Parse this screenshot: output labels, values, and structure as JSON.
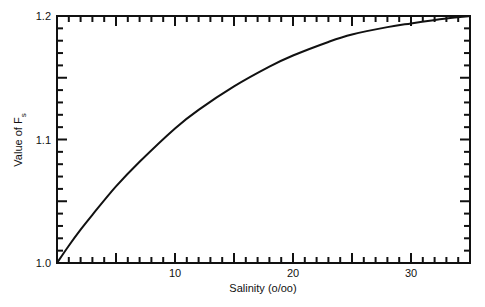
{
  "chart_data": {
    "type": "line",
    "title": "",
    "xlabel": "Salinity (o/oo)",
    "ylabel": "Value of F_s",
    "ylabel_main": "Value of F",
    "ylabel_sub": "s",
    "xlim": [
      0,
      35
    ],
    "ylim": [
      1.0,
      1.2
    ],
    "x_tick_labels": [
      "10",
      "20",
      "30"
    ],
    "x_tick_values": [
      10,
      20,
      30
    ],
    "y_tick_labels": [
      "1.0",
      "1.1",
      "1.2"
    ],
    "y_tick_values": [
      1.0,
      1.1,
      1.2
    ],
    "minor_x_tick_step": 1,
    "major_x_tick_step": 5,
    "minor_y_tick_step": 0.01,
    "major_y_tick_step": 0.05,
    "grid": false,
    "legend": null,
    "series": [
      {
        "name": "F_s",
        "x": [
          0,
          1,
          2,
          3,
          5,
          7,
          10,
          12,
          15,
          18,
          20,
          23,
          25,
          28,
          30,
          33,
          35
        ],
        "y": [
          1.0,
          1.014,
          1.027,
          1.039,
          1.062,
          1.082,
          1.109,
          1.124,
          1.143,
          1.159,
          1.168,
          1.179,
          1.185,
          1.191,
          1.194,
          1.198,
          1.2
        ]
      }
    ]
  }
}
